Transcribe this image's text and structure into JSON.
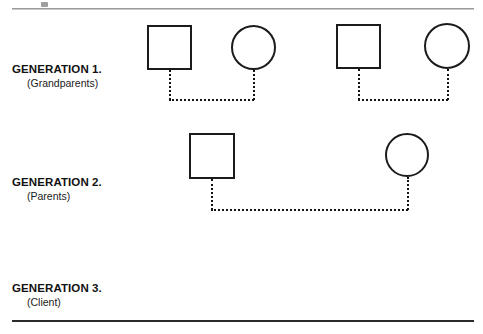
{
  "document": {
    "type": "genogram-worksheet",
    "background_color": "#ffffff",
    "ink_color": "#1b1b1b",
    "top_rule_color": "#9a9a9a",
    "bottom_rule_color": "#2b2b2b"
  },
  "generations": [
    {
      "id": "generation-1",
      "title": "GENERATION 1.",
      "subtitle": "(Grandparents)"
    },
    {
      "id": "generation-2",
      "title": "GENERATION 2.",
      "subtitle": "(Parents)"
    },
    {
      "id": "generation-3",
      "title": "GENERATION 3.",
      "subtitle": "(Client)"
    }
  ],
  "diagram": {
    "symbol_legend": {
      "square": "male",
      "circle": "female",
      "dotted_line": "relationship-link"
    },
    "nodes": [
      {
        "id": "g1-male-1",
        "shape": "square",
        "generation": 1,
        "x": 147,
        "y": 25,
        "w": 45,
        "h": 45
      },
      {
        "id": "g1-female-1",
        "shape": "circle",
        "generation": 1,
        "x": 231,
        "y": 25,
        "w": 45,
        "h": 45
      },
      {
        "id": "g1-male-2",
        "shape": "square",
        "generation": 1,
        "x": 336,
        "y": 24,
        "w": 45,
        "h": 45
      },
      {
        "id": "g1-female-2",
        "shape": "circle",
        "generation": 1,
        "x": 424,
        "y": 23,
        "w": 46,
        "h": 46
      },
      {
        "id": "g2-male-1",
        "shape": "square",
        "generation": 2,
        "x": 189,
        "y": 133,
        "w": 46,
        "h": 46
      },
      {
        "id": "g2-female-1",
        "shape": "circle",
        "generation": 2,
        "x": 385,
        "y": 133,
        "w": 44,
        "h": 44
      }
    ],
    "connectors": [
      {
        "id": "g1-couple-1-drop-left",
        "orientation": "vertical",
        "x": 169,
        "y": 70,
        "length": 30
      },
      {
        "id": "g1-couple-1-drop-right",
        "orientation": "vertical",
        "x": 253,
        "y": 70,
        "length": 30
      },
      {
        "id": "g1-couple-1-base",
        "orientation": "horizontal",
        "x": 169,
        "y": 99,
        "length": 85
      },
      {
        "id": "g1-couple-2-drop-left",
        "orientation": "vertical",
        "x": 358,
        "y": 69,
        "length": 31
      },
      {
        "id": "g1-couple-2-drop-right",
        "orientation": "vertical",
        "x": 447,
        "y": 69,
        "length": 31
      },
      {
        "id": "g1-couple-2-base",
        "orientation": "horizontal",
        "x": 358,
        "y": 99,
        "length": 90
      },
      {
        "id": "g2-couple-drop-left",
        "orientation": "vertical",
        "x": 211,
        "y": 179,
        "length": 31
      },
      {
        "id": "g2-couple-drop-right",
        "orientation": "vertical",
        "x": 407,
        "y": 177,
        "length": 33
      },
      {
        "id": "g2-couple-base",
        "orientation": "horizontal",
        "x": 211,
        "y": 209,
        "length": 197
      }
    ]
  }
}
